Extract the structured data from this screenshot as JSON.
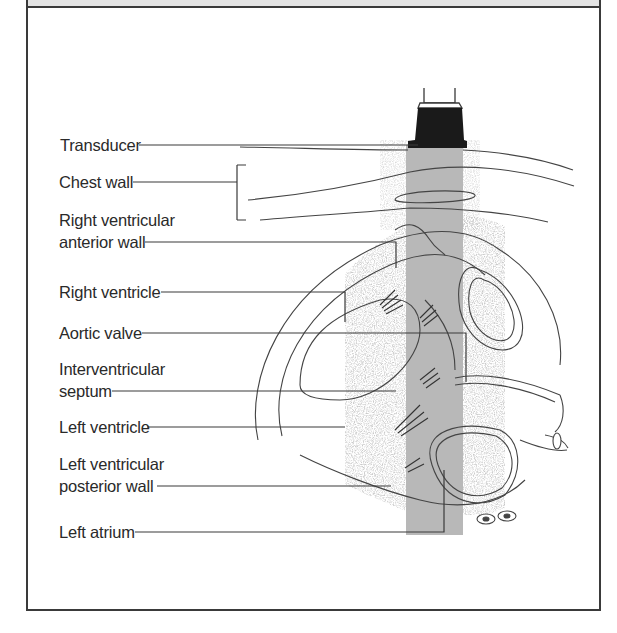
{
  "diagram": {
    "labels": [
      {
        "id": "transducer",
        "text": "Transducer"
      },
      {
        "id": "chest-wall",
        "text": "Chest wall"
      },
      {
        "id": "rv-anterior-wall-1",
        "text": "Right ventricular"
      },
      {
        "id": "rv-anterior-wall-2",
        "text": "anterior wall"
      },
      {
        "id": "right-ventricle",
        "text": "Right ventricle"
      },
      {
        "id": "aortic-valve",
        "text": "Aortic valve"
      },
      {
        "id": "ivs-1",
        "text": "Interventricular"
      },
      {
        "id": "ivs-2",
        "text": "septum"
      },
      {
        "id": "left-ventricle",
        "text": "Left ventricle"
      },
      {
        "id": "lv-posterior-wall-1",
        "text": "Left ventricular"
      },
      {
        "id": "lv-posterior-wall-2",
        "text": "posterior wall"
      },
      {
        "id": "left-atrium",
        "text": "Left atrium"
      }
    ],
    "colors": {
      "line": "#3a3a3a",
      "beam": "#b8b8b8",
      "transducer": "#1a1a1a",
      "speckle": "#c8c8c8",
      "frame_band": "#e4e4e4"
    }
  }
}
